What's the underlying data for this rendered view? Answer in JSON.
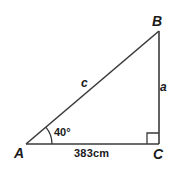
{
  "diagram": {
    "type": "right-triangle",
    "colors": {
      "stroke": "#3a3a3a",
      "text": "#1a1a1a",
      "background": "#ffffff"
    },
    "vertices": {
      "A": {
        "label": "A"
      },
      "B": {
        "label": "B"
      },
      "C": {
        "label": "C"
      }
    },
    "sides": {
      "hypotenuse": {
        "label": "c",
        "from": "A",
        "to": "B"
      },
      "opposite": {
        "label": "a",
        "from": "B",
        "to": "C"
      },
      "adjacent": {
        "label": "383cm",
        "from": "A",
        "to": "C"
      }
    },
    "angles": {
      "A": {
        "label": "40°"
      },
      "C": {
        "label": "right-angle"
      }
    }
  }
}
